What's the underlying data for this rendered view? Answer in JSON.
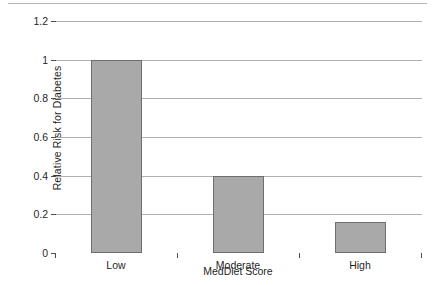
{
  "chart_data": {
    "type": "bar",
    "title": "",
    "categories": [
      "Low",
      "Moderate",
      "High"
    ],
    "values": [
      1.0,
      0.4,
      0.16
    ],
    "xlabel": "MedDiet Score",
    "ylabel": "Relative Risk for Diabetes",
    "ylim": [
      0,
      1.2
    ],
    "yticks": [
      0,
      0.2,
      0.4,
      0.6,
      0.8,
      1,
      1.2
    ],
    "ytick_labels": [
      "0",
      "0.2",
      "0.4",
      "0.6",
      "0.8",
      "1",
      "1.2"
    ],
    "grid": "horizontal",
    "legend": "none",
    "bar_color": "#a9a9a9",
    "bar_border_color": "#6e6e6e",
    "gridline_color": "#b0b0b0",
    "axis_color": "#4d4d4d",
    "background": "#ffffff"
  }
}
